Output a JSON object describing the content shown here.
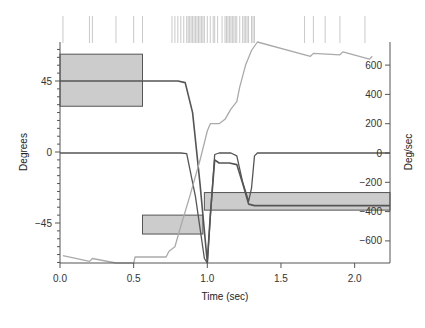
{
  "chart_data": {
    "type": "line",
    "title": "",
    "xlabel": "Time (sec)",
    "ylabel_left": "Degrees",
    "ylabel_right": "Deg/sec",
    "xlim": [
      0,
      2.24
    ],
    "ylim_left": [
      -70,
      70
    ],
    "ylim_right": [
      -752,
      757
    ],
    "x_ticks": [
      {
        "value": 0.0,
        "label": "0.0"
      },
      {
        "value": 0.5,
        "label": "0.5"
      },
      {
        "value": 1.0,
        "label": "1.0"
      },
      {
        "value": 1.5,
        "label": "1.5"
      },
      {
        "value": 2.0,
        "label": "2.0"
      }
    ],
    "y_left_ticks": [
      {
        "value": 45,
        "label": "45"
      },
      {
        "value": 0,
        "label": "0"
      },
      {
        "value": -45,
        "label": "-45"
      }
    ],
    "y_right_ticks": [
      {
        "value": 600,
        "label": "600"
      },
      {
        "value": 400,
        "label": "400"
      },
      {
        "value": 200,
        "label": "200"
      },
      {
        "value": 0,
        "label": "0"
      },
      {
        "value": -200,
        "label": "-200"
      },
      {
        "value": -400,
        "label": "-400"
      },
      {
        "value": -600,
        "label": "-600"
      }
    ],
    "series": [
      {
        "name": "Eye position (deg)",
        "axis": "left",
        "color": "#555555",
        "points": [
          [
            0,
            45
          ],
          [
            0.8,
            45
          ],
          [
            0.85,
            44
          ],
          [
            0.9,
            25
          ],
          [
            0.95,
            -20
          ],
          [
            1.0,
            -70
          ],
          [
            1.02,
            -40
          ],
          [
            1.05,
            -5
          ],
          [
            1.08,
            -7
          ],
          [
            1.15,
            -7
          ],
          [
            1.2,
            -8
          ],
          [
            1.24,
            -20
          ],
          [
            1.28,
            -33
          ],
          [
            1.32,
            -34
          ],
          [
            2.24,
            -34
          ]
        ]
      },
      {
        "name": "Eye velocity (deg/sec)",
        "axis": "right",
        "color": "#555555",
        "points": [
          [
            0,
            0
          ],
          [
            0.82,
            0
          ],
          [
            0.86,
            -5
          ],
          [
            0.92,
            -300
          ],
          [
            0.98,
            -720
          ],
          [
            1.0,
            -752
          ],
          [
            1.03,
            -300
          ],
          [
            1.05,
            -10
          ],
          [
            1.08,
            0
          ],
          [
            1.16,
            0
          ],
          [
            1.2,
            -20
          ],
          [
            1.24,
            -200
          ],
          [
            1.28,
            -330
          ],
          [
            1.3,
            -240
          ],
          [
            1.32,
            -20
          ],
          [
            1.34,
            0
          ],
          [
            2.24,
            0
          ]
        ]
      },
      {
        "name": "Cumulative (gray)",
        "axis": "right",
        "color": "#aaaaaa",
        "points": [
          [
            0.02,
            -700
          ],
          [
            0.2,
            -740
          ],
          [
            0.22,
            -720
          ],
          [
            0.38,
            -752
          ],
          [
            0.5,
            -752
          ],
          [
            0.51,
            -710
          ],
          [
            0.72,
            -710
          ],
          [
            0.74,
            -670
          ],
          [
            0.78,
            -640
          ],
          [
            0.82,
            -500
          ],
          [
            0.88,
            -300
          ],
          [
            0.95,
            -50
          ],
          [
            1.0,
            150
          ],
          [
            1.02,
            200
          ],
          [
            1.08,
            200
          ],
          [
            1.12,
            230
          ],
          [
            1.16,
            300
          ],
          [
            1.2,
            350
          ],
          [
            1.22,
            450
          ],
          [
            1.26,
            600
          ],
          [
            1.3,
            700
          ],
          [
            1.34,
            760
          ],
          [
            1.7,
            660
          ],
          [
            1.72,
            680
          ],
          [
            1.9,
            670
          ],
          [
            1.92,
            690
          ],
          [
            2.1,
            640
          ],
          [
            2.12,
            660
          ]
        ]
      }
    ],
    "target_boxes": [
      {
        "t0": 0.0,
        "t1": 0.56,
        "deg_top": 62,
        "deg_bottom": 29,
        "axis": "left"
      },
      {
        "t0": 0.56,
        "t1": 0.97,
        "deg_top": -40,
        "deg_bottom": -52,
        "axis": "left"
      },
      {
        "t0": 0.98,
        "t1": 2.24,
        "vel_top": -270,
        "vel_bottom": -390,
        "axis": "right"
      }
    ],
    "raster_ticks": [
      0.02,
      0.2,
      0.22,
      0.38,
      0.5,
      0.56,
      0.76,
      0.78,
      0.8,
      0.82,
      0.84,
      0.86,
      0.87,
      0.88,
      0.89,
      0.9,
      0.91,
      0.92,
      0.93,
      0.94,
      0.95,
      0.96,
      0.97,
      0.98,
      1.0,
      1.02,
      1.04,
      1.05,
      1.07,
      1.1,
      1.12,
      1.13,
      1.14,
      1.15,
      1.16,
      1.17,
      1.18,
      1.19,
      1.2,
      1.22,
      1.24,
      1.25,
      1.26,
      1.27,
      1.28,
      1.3,
      1.31,
      1.32,
      1.66,
      1.72,
      1.8,
      1.9,
      2.07
    ]
  },
  "colors": {
    "axis": "#555555",
    "trace": "#555555",
    "gray_trace": "#aaaaaa",
    "box_fill": "#cccccc",
    "box_stroke": "#555555",
    "raster": "#bbbbbb"
  }
}
